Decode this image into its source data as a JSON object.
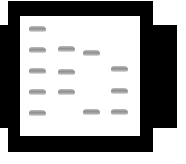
{
  "diagram": {
    "type": "gel-electrophoresis",
    "colors": {
      "frame": "#000000",
      "gel": "#ffffff",
      "band": "#9a9a9a"
    },
    "frame": {
      "x": 8,
      "y": 1,
      "w": 145,
      "h": 151
    },
    "gel": {
      "x": 20,
      "y": 16,
      "w": 120,
      "h": 120
    },
    "tabs": [
      {
        "side": "left",
        "x": 0,
        "y": 25,
        "w": 9,
        "h": 103
      },
      {
        "side": "right",
        "x": 152,
        "y": 25,
        "w": 25,
        "h": 103
      }
    ],
    "lanes": [
      {
        "lane": 1,
        "x": 29,
        "bands_y": [
          26,
          47,
          68,
          89,
          110
        ]
      },
      {
        "lane": 2,
        "x": 58,
        "bands_y": [
          46,
          69,
          89
        ]
      },
      {
        "lane": 3,
        "x": 83,
        "bands_y": [
          50,
          109
        ]
      },
      {
        "lane": 4,
        "x": 111,
        "bands_y": [
          66,
          88,
          109
        ]
      }
    ],
    "band_width": 17
  }
}
